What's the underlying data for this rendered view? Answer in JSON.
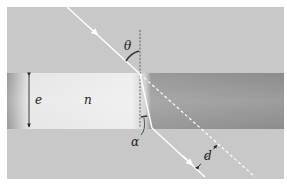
{
  "diagram": {
    "type": "optics-refraction-slab",
    "labels": {
      "theta": "θ",
      "alpha": "α",
      "thickness": "e",
      "index": "n",
      "displacement": "d"
    },
    "colors": {
      "background": "#c9c9c9",
      "slab_light": "#ececec",
      "slab_dark": "#8f8f8f",
      "slab_edge": "#9a9a9a",
      "ray": "#ffffff",
      "ink": "#222222"
    }
  }
}
